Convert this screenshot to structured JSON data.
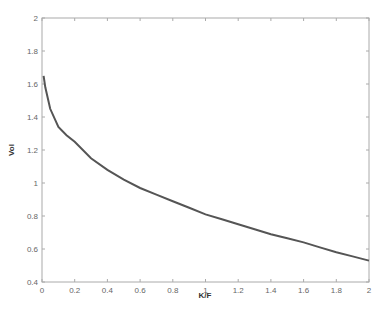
{
  "chart_data": {
    "type": "line",
    "title": "",
    "xlabel": "K/F",
    "ylabel": "Vol",
    "xlim": [
      0,
      2
    ],
    "ylim": [
      0.4,
      2
    ],
    "xticks": [
      "0",
      "0.2",
      "0.4",
      "0.6",
      "0.8",
      "1",
      "1.2",
      "1.4",
      "1.6",
      "1.8",
      "2"
    ],
    "yticks": [
      "0.4",
      "0.6",
      "0.8",
      "1",
      "1.2",
      "1.4",
      "1.6",
      "1.8",
      "2"
    ],
    "grid": false,
    "legend": null,
    "series": [
      {
        "name": "Vol",
        "color": "#555555",
        "x": [
          0.01,
          0.02,
          0.05,
          0.1,
          0.15,
          0.2,
          0.3,
          0.4,
          0.5,
          0.6,
          0.7,
          0.8,
          0.9,
          1.0,
          1.1,
          1.2,
          1.3,
          1.4,
          1.5,
          1.6,
          1.7,
          1.8,
          1.9,
          2.0
        ],
        "y": [
          1.65,
          1.58,
          1.45,
          1.34,
          1.29,
          1.25,
          1.15,
          1.08,
          1.02,
          0.97,
          0.93,
          0.89,
          0.85,
          0.81,
          0.78,
          0.75,
          0.72,
          0.69,
          0.665,
          0.64,
          0.61,
          0.58,
          0.555,
          0.53
        ]
      }
    ]
  }
}
